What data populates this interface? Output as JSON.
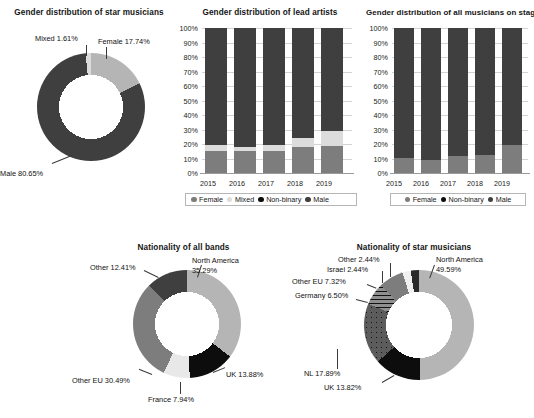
{
  "colors": {
    "dark": "#3f3f3f",
    "black": "#0d0d0d",
    "mid_gray": "#7d7d7d",
    "light_gray": "#b5b5b5",
    "pale_gray": "#dcdcdc",
    "white": "#f2f2f2"
  },
  "charts": {
    "star_gender_donut": {
      "title": "Gender distribution of star musicians",
      "type": "pie",
      "labels": [
        "Female 17.74%",
        "Male 80.65%",
        "Mixed 1.61%"
      ],
      "categories": [
        "Female",
        "Male",
        "Mixed"
      ],
      "values": [
        17.74,
        80.65,
        1.61
      ]
    },
    "lead_artists_bar": {
      "title": "Gender distribution of lead artists",
      "type": "bar",
      "categories": [
        "2015",
        "2016",
        "2017",
        "2018",
        "2019"
      ],
      "yticks": [
        "100%",
        "90%",
        "80%",
        "70%",
        "60%",
        "50%",
        "40%",
        "30%",
        "20%",
        "10%",
        "0%"
      ],
      "ylim": [
        0,
        100
      ],
      "series": [
        {
          "name": "Female",
          "values": [
            15.0,
            15.0,
            15.5,
            18.0,
            18.5
          ]
        },
        {
          "name": "Mixed",
          "values": [
            4.0,
            3.0,
            4.0,
            6.0,
            10.5
          ]
        },
        {
          "name": "Non-binary",
          "values": [
            0.0,
            0.0,
            0.0,
            0.0,
            0.0
          ]
        },
        {
          "name": "Male",
          "values": [
            81.0,
            82.0,
            80.5,
            76.0,
            71.0
          ]
        }
      ],
      "legend": [
        "Female",
        "Mixed",
        "Non-binary",
        "Male"
      ]
    },
    "all_musicians_bar": {
      "title": "Gender distribution of all musicians on stage",
      "type": "bar",
      "categories": [
        "2015",
        "2016",
        "2017",
        "2018",
        "2019"
      ],
      "yticks": [
        "100%",
        "90%",
        "80%",
        "70%",
        "60%",
        "50%",
        "40%",
        "30%",
        "20%",
        "10%",
        "0%"
      ],
      "ylim": [
        0,
        100
      ],
      "series": [
        {
          "name": "Female",
          "values": [
            10.5,
            9.0,
            12.0,
            12.5,
            19.0
          ]
        },
        {
          "name": "Non-binary",
          "values": [
            0.0,
            0.0,
            0.0,
            0.0,
            0.0
          ]
        },
        {
          "name": "Male",
          "values": [
            89.5,
            91.0,
            88.0,
            87.5,
            81.0
          ]
        }
      ],
      "legend": [
        "Female",
        "Non-binary",
        "Male"
      ]
    },
    "bands_nationality_donut": {
      "title": "Nationality of all bands",
      "type": "pie",
      "labels": [
        "North America 35.29%",
        "UK 13.88%",
        "France 7.94%",
        "Other EU 30.49%",
        "Other 12.41%"
      ],
      "categories": [
        "North America",
        "UK",
        "France",
        "Other EU",
        "Other"
      ],
      "values": [
        35.29,
        13.88,
        7.94,
        30.49,
        12.41
      ]
    },
    "star_nationality_donut": {
      "title": "Nationality of star musicians",
      "type": "pie",
      "labels": [
        "North America 49.59%",
        "UK 13.82%",
        "NL 17.89%",
        "Germany 6.50%",
        "Other EU 7.32%",
        "Israel 2.44%",
        "Other 2.44%"
      ],
      "categories": [
        "North America",
        "UK",
        "NL",
        "Germany",
        "Other EU",
        "Israel",
        "Other"
      ],
      "values": [
        49.59,
        13.82,
        17.89,
        6.5,
        7.32,
        2.44,
        2.44
      ]
    }
  }
}
